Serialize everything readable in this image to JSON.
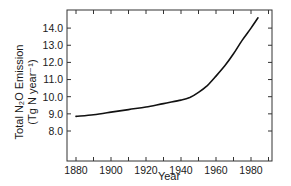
{
  "chart_data": {
    "type": "line",
    "title": "",
    "xlabel": "Year",
    "ylabel": "Total N₂O Emission (Tg N year⁻¹)",
    "ylabel_line1": "Total N₂O Emission",
    "ylabel_line2": "(Tg N year⁻¹)",
    "xlim": [
      1875,
      1993
    ],
    "ylim": [
      6.8,
      15.6
    ],
    "x_ticks_major": [
      1880,
      1900,
      1920,
      1940,
      1960,
      1980
    ],
    "x_ticks_minor": [
      1890,
      1910,
      1930,
      1950,
      1970,
      1990
    ],
    "y_ticks": [
      8.0,
      9.0,
      10.0,
      11.0,
      12.0,
      13.0,
      14.0
    ],
    "y_tick_labels": [
      "8.0",
      "9.0",
      "10.0",
      "11.0",
      "12.0",
      "13.0",
      "14.0"
    ],
    "x_tick_labels": [
      "1880",
      "1900",
      "1920",
      "1940",
      "1960",
      "1980"
    ],
    "grid": false,
    "legend": null,
    "series": [
      {
        "name": "Total N2O Emission",
        "color": "#111111",
        "x": [
          1880,
          1890,
          1900,
          1910,
          1920,
          1930,
          1940,
          1945,
          1950,
          1955,
          1960,
          1965,
          1970,
          1975,
          1980,
          1984
        ],
        "values": [
          8.85,
          8.95,
          9.1,
          9.25,
          9.4,
          9.6,
          9.8,
          9.95,
          10.25,
          10.65,
          11.2,
          11.8,
          12.5,
          13.3,
          14.0,
          14.6
        ]
      }
    ]
  }
}
